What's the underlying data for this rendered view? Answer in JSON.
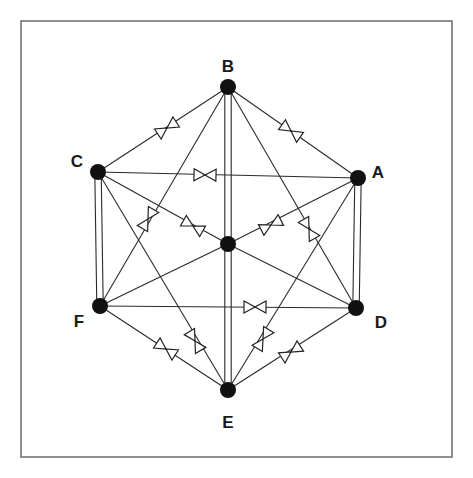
{
  "diagram": {
    "title": "",
    "frame": {
      "x": 21,
      "y": 21,
      "width": 431,
      "height": 436,
      "color": "#6a6a6a"
    },
    "nodes": [
      {
        "id": "A",
        "label": "A",
        "x": 358,
        "y": 178,
        "label_x": 378,
        "label_y": 174
      },
      {
        "id": "B",
        "label": "B",
        "x": 228,
        "y": 87,
        "label_x": 228,
        "label_y": 68
      },
      {
        "id": "C",
        "label": "C",
        "x": 98,
        "y": 172,
        "label_x": 77,
        "label_y": 163
      },
      {
        "id": "D",
        "label": "D",
        "x": 356,
        "y": 308,
        "label_x": 381,
        "label_y": 324
      },
      {
        "id": "E",
        "label": "E",
        "x": 228,
        "y": 390,
        "label_x": 228,
        "label_y": 424
      },
      {
        "id": "F",
        "label": "F",
        "x": 100,
        "y": 306,
        "label_x": 79,
        "label_y": 323
      },
      {
        "id": "O",
        "label": "",
        "x": 228,
        "y": 244,
        "label_x": 0,
        "label_y": 0
      }
    ],
    "edges": [
      {
        "from": "B",
        "to": "C",
        "type": "single",
        "valve": true,
        "valve_x": 167,
        "valve_y": 128
      },
      {
        "from": "B",
        "to": "A",
        "type": "single",
        "valve": true,
        "valve_x": 291,
        "valve_y": 131
      },
      {
        "from": "C",
        "to": "A",
        "type": "single",
        "valve": true,
        "valve_x": 205,
        "valve_y": 175
      },
      {
        "from": "B",
        "to": "F",
        "type": "single",
        "valve": true,
        "valve_x": 148,
        "valve_y": 219
      },
      {
        "from": "B",
        "to": "D",
        "type": "single",
        "valve": true,
        "valve_x": 309,
        "valve_y": 229
      },
      {
        "from": "C",
        "to": "O",
        "type": "single",
        "valve": true,
        "valve_x": 193,
        "valve_y": 226
      },
      {
        "from": "A",
        "to": "O",
        "type": "single",
        "valve": true,
        "valve_x": 271,
        "valve_y": 225
      },
      {
        "from": "O",
        "to": "F",
        "type": "single",
        "valve": false
      },
      {
        "from": "O",
        "to": "D",
        "type": "single",
        "valve": false
      },
      {
        "from": "C",
        "to": "E",
        "type": "single",
        "valve": true,
        "valve_x": 195,
        "valve_y": 341
      },
      {
        "from": "A",
        "to": "E",
        "type": "single",
        "valve": true,
        "valve_x": 263,
        "valve_y": 339
      },
      {
        "from": "F",
        "to": "D",
        "type": "single",
        "valve": true,
        "valve_x": 255,
        "valve_y": 307
      },
      {
        "from": "F",
        "to": "E",
        "type": "single",
        "valve": true,
        "valve_x": 166,
        "valve_y": 349
      },
      {
        "from": "D",
        "to": "E",
        "type": "single",
        "valve": true,
        "valve_x": 291,
        "valve_y": 352
      },
      {
        "from": "B",
        "to": "E",
        "type": "double",
        "valve": false
      },
      {
        "from": "C",
        "to": "F",
        "type": "double",
        "valve": false
      },
      {
        "from": "A",
        "to": "D",
        "type": "double",
        "valve": false
      }
    ]
  },
  "labels": {
    "A": "A",
    "B": "B",
    "C": "C",
    "D": "D",
    "E": "E",
    "F": "F"
  }
}
